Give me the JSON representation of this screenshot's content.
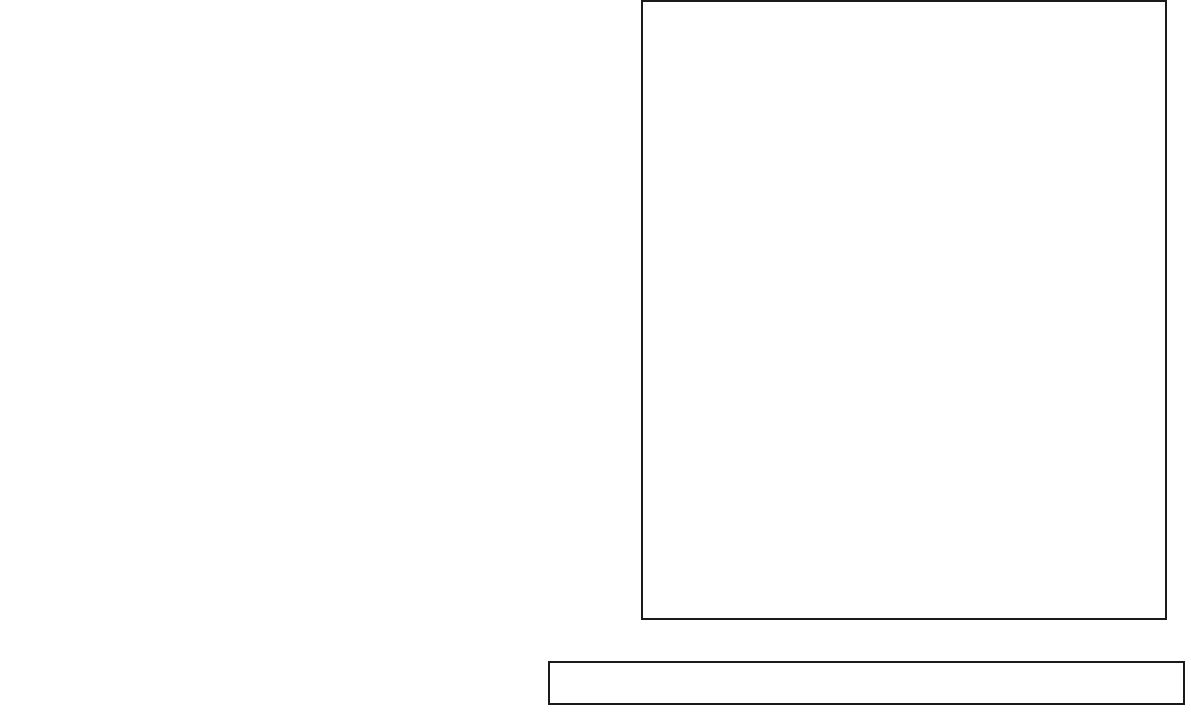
{
  "chart_data": {
    "type": "bar",
    "subtype": "horizontal-stacked-bar",
    "title": "",
    "xlabel": "",
    "ylabel": "",
    "xlim": [
      0,
      100
    ],
    "xticks": [
      0,
      25,
      50,
      75,
      100
    ],
    "xtick_labels": [
      "0%",
      "25%",
      "50%",
      "75%",
      "100%"
    ],
    "grid": true,
    "grid_style": "dashed-vertical",
    "legend_position": "bottom",
    "categories": [
      "Is dressed too provocatively",
      "Has typos or grammatical errors in cover letter and/or résumé",
      "Is late for the interview",
      "Talks negatively about a previous supervisor/boss",
      "Talks negatively about a previous job/internship",
      "The applicant’s cell phone rings during the interview",
      "Brings food or drink to the interview",
      "Is dressed too casually",
      "Includes a photo of self in the résumé and/or cover letter",
      "Is overly casual/familiar (i.e., as if talking to friends)",
      "Asks about vacation time or sick time prematurely",
      "Asks about work hours prematurely",
      "Has unprofessional email address (e.g., smileyface@yahoo.com)",
      "Doesn’t send a thank-you note after the interview",
      "Drops names in cover letter, résumé, and/or during the interview",
      "Arrives more than 10 minutes early for the interview"
    ],
    "series": [
      {
        "name": "A major problem/a deal breaker",
        "color": "#3c3c3c",
        "values": [
          67,
          58,
          58,
          49,
          42,
          40,
          31,
          27,
          20,
          18,
          15,
          7,
          5,
          5,
          3,
          1
        ],
        "labels": [
          "67%",
          "58%",
          "58%",
          "49%",
          "42%",
          "40%",
          "31%",
          "27%",
          "20%",
          "18%",
          "15%",
          "7%",
          "",
          "",
          "",
          ""
        ]
      },
      {
        "name": "Somewhat of a problem",
        "color": "#cbcbcb",
        "values": [
          28,
          41,
          39,
          46,
          53,
          51,
          48,
          68,
          44,
          65,
          54,
          35,
          48,
          31,
          54,
          14
        ],
        "labels": [
          "28%",
          "41%",
          "39%",
          "46%",
          "53%",
          "51%",
          "48%",
          "68%",
          "44%",
          "65%",
          "54%",
          "35%",
          "48%",
          "31%",
          "54%",
          "14%"
        ]
      }
    ]
  },
  "legend": {
    "items": [
      {
        "label": "A major problem/a deal breaker",
        "color": "#3c3c3c"
      },
      {
        "label": "Somewhat of a problem",
        "color": "#cbcbcb"
      }
    ]
  },
  "axis": {
    "tick_labels": [
      "0%",
      "25%",
      "50%",
      "75%",
      "100%"
    ]
  }
}
